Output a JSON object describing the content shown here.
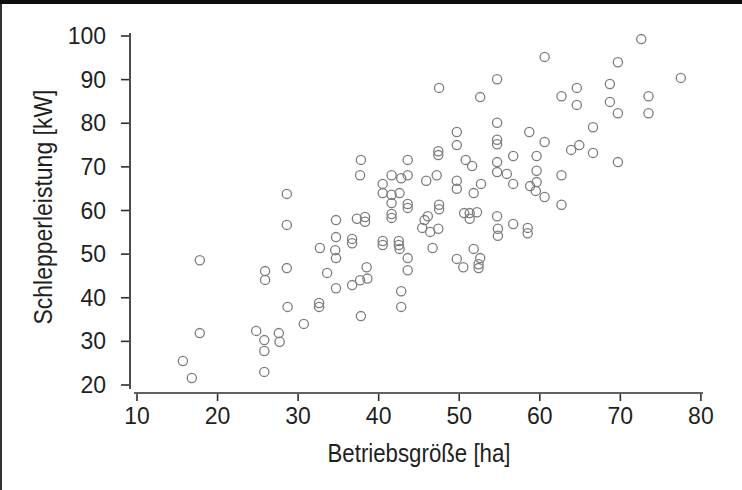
{
  "figure": {
    "width_px": 742,
    "height_px": 490,
    "background_color": "#ffffff",
    "text_color": "#1f1f1f",
    "axis_color": "#2e2e2e",
    "scan_edge_color": "#0e0e0e"
  },
  "chart_data": {
    "type": "scatter",
    "title": "",
    "xlabel": "Betriebsgröße [ha]",
    "ylabel": "Schlepperleistung [kW]",
    "xlim": [
      10,
      80
    ],
    "ylim": [
      20,
      100
    ],
    "x_ticks": [
      "10",
      "20",
      "30",
      "40",
      "50",
      "60",
      "70",
      "80"
    ],
    "y_ticks": [
      "20",
      "30",
      "40",
      "50",
      "60",
      "70",
      "80",
      "90",
      "100"
    ],
    "x_tick_values": [
      10,
      20,
      30,
      40,
      50,
      60,
      70,
      80
    ],
    "y_tick_values": [
      20,
      30,
      40,
      50,
      60,
      70,
      80,
      90,
      100
    ],
    "grid": false,
    "legend": "none",
    "marker": {
      "shape": "open-circle",
      "radius_px": 4.6,
      "color": "#7d7d7d",
      "stroke_width": 1.3
    },
    "points": [
      [
        15.7,
        25.5
      ],
      [
        16.8,
        21.6
      ],
      [
        17.8,
        48.6
      ],
      [
        17.8,
        31.9
      ],
      [
        24.8,
        32.4
      ],
      [
        25.8,
        30.3
      ],
      [
        25.8,
        27.8
      ],
      [
        25.8,
        23.0
      ],
      [
        25.9,
        46.1
      ],
      [
        25.9,
        44.1
      ],
      [
        27.6,
        31.9
      ],
      [
        27.7,
        29.9
      ],
      [
        28.6,
        63.8
      ],
      [
        28.6,
        56.7
      ],
      [
        28.6,
        46.8
      ],
      [
        28.7,
        37.9
      ],
      [
        30.7,
        34.0
      ],
      [
        32.6,
        38.8
      ],
      [
        32.6,
        37.9
      ],
      [
        32.7,
        51.4
      ],
      [
        33.6,
        45.7
      ],
      [
        34.6,
        50.9
      ],
      [
        34.7,
        57.8
      ],
      [
        34.7,
        53.9
      ],
      [
        34.7,
        49.1
      ],
      [
        34.7,
        42.2
      ],
      [
        36.7,
        42.9
      ],
      [
        37.7,
        44.0
      ],
      [
        38.6,
        44.4
      ],
      [
        37.8,
        35.8
      ],
      [
        38.5,
        47.0
      ],
      [
        36.7,
        53.5
      ],
      [
        36.7,
        52.5
      ],
      [
        37.3,
        58.1
      ],
      [
        38.3,
        58.5
      ],
      [
        38.3,
        57.4
      ],
      [
        37.7,
        68.1
      ],
      [
        37.8,
        71.6
      ],
      [
        40.5,
        66.1
      ],
      [
        40.5,
        64.0
      ],
      [
        40.5,
        53.0
      ],
      [
        40.5,
        52.1
      ],
      [
        41.6,
        68.1
      ],
      [
        41.6,
        63.6
      ],
      [
        41.6,
        61.7
      ],
      [
        41.6,
        59.2
      ],
      [
        41.6,
        58.3
      ],
      [
        42.5,
        53.0
      ],
      [
        42.5,
        52.1
      ],
      [
        42.6,
        51.2
      ],
      [
        42.6,
        64.0
      ],
      [
        42.8,
        67.4
      ],
      [
        42.8,
        41.5
      ],
      [
        42.8,
        37.9
      ],
      [
        43.6,
        71.6
      ],
      [
        43.6,
        68.1
      ],
      [
        43.6,
        61.5
      ],
      [
        43.6,
        60.6
      ],
      [
        43.6,
        49.1
      ],
      [
        43.6,
        46.3
      ],
      [
        45.4,
        56.0
      ],
      [
        45.7,
        57.8
      ],
      [
        45.9,
        66.8
      ],
      [
        46.1,
        58.7
      ],
      [
        46.4,
        55.1
      ],
      [
        46.7,
        51.4
      ],
      [
        47.2,
        68.1
      ],
      [
        47.4,
        55.8
      ],
      [
        47.4,
        73.6
      ],
      [
        47.4,
        72.7
      ],
      [
        47.5,
        61.3
      ],
      [
        47.5,
        60.3
      ],
      [
        47.5,
        88.1
      ],
      [
        49.7,
        78.0
      ],
      [
        49.7,
        75.0
      ],
      [
        49.7,
        66.8
      ],
      [
        49.7,
        65.0
      ],
      [
        49.7,
        48.9
      ],
      [
        50.5,
        47.0
      ],
      [
        50.8,
        71.6
      ],
      [
        50.6,
        59.4
      ],
      [
        51.3,
        59.4
      ],
      [
        51.3,
        58.1
      ],
      [
        51.6,
        70.2
      ],
      [
        51.8,
        64.0
      ],
      [
        51.8,
        51.2
      ],
      [
        52.2,
        59.6
      ],
      [
        52.4,
        47.7
      ],
      [
        52.4,
        46.8
      ],
      [
        52.6,
        49.1
      ],
      [
        52.6,
        86.0
      ],
      [
        52.7,
        66.1
      ],
      [
        54.7,
        90.1
      ],
      [
        54.7,
        80.1
      ],
      [
        54.7,
        76.2
      ],
      [
        54.7,
        75.2
      ],
      [
        54.7,
        71.1
      ],
      [
        54.7,
        68.8
      ],
      [
        54.7,
        58.7
      ],
      [
        54.8,
        55.8
      ],
      [
        54.8,
        54.2
      ],
      [
        55.9,
        68.4
      ],
      [
        56.7,
        72.5
      ],
      [
        56.7,
        66.1
      ],
      [
        56.7,
        56.9
      ],
      [
        58.5,
        56.0
      ],
      [
        58.5,
        54.8
      ],
      [
        58.7,
        78.0
      ],
      [
        58.8,
        65.6
      ],
      [
        59.5,
        64.5
      ],
      [
        59.6,
        72.5
      ],
      [
        59.6,
        69.1
      ],
      [
        59.6,
        66.5
      ],
      [
        60.6,
        95.2
      ],
      [
        60.6,
        75.7
      ],
      [
        60.6,
        63.1
      ],
      [
        62.7,
        86.2
      ],
      [
        62.7,
        68.1
      ],
      [
        62.7,
        61.3
      ],
      [
        63.9,
        73.9
      ],
      [
        64.6,
        88.1
      ],
      [
        64.6,
        84.2
      ],
      [
        64.9,
        75.0
      ],
      [
        66.6,
        79.1
      ],
      [
        66.6,
        73.2
      ],
      [
        68.7,
        89.0
      ],
      [
        68.7,
        84.9
      ],
      [
        69.7,
        94.0
      ],
      [
        69.7,
        82.3
      ],
      [
        69.7,
        71.1
      ],
      [
        72.6,
        99.3
      ],
      [
        73.5,
        86.2
      ],
      [
        73.5,
        82.3
      ],
      [
        77.5,
        90.4
      ]
    ]
  }
}
